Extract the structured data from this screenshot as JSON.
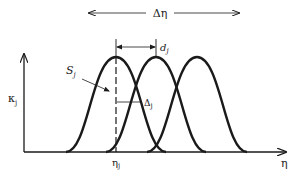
{
  "diagram": {
    "type": "overlapping-bell-curves",
    "colors": {
      "stroke": "#1a1a1a",
      "background": "#ffffff"
    },
    "top_span": {
      "label": "Δη"
    },
    "y_axis": {
      "label_main": "κ",
      "label_sub": "j"
    },
    "x_axis": {
      "label": "η"
    },
    "peak_marker": {
      "label_main": "η",
      "label_sub": "j"
    },
    "spacing": {
      "label_main": "d",
      "label_sub": "j"
    },
    "curve_label": {
      "label_main": "S",
      "label_sub": "j"
    },
    "width_marker": {
      "label_main": "Δ",
      "label_sub": "j"
    },
    "curves": [
      {
        "name": "curve-1",
        "peak_x": 116
      },
      {
        "name": "curve-2",
        "peak_x": 156
      },
      {
        "name": "curve-3",
        "peak_x": 197
      }
    ]
  }
}
